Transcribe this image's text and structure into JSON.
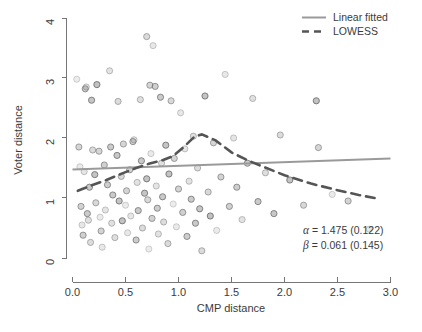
{
  "chart_data": {
    "type": "scatter",
    "title": "",
    "xlabel": "CMP distance",
    "ylabel": "Voter distance",
    "xlim": [
      0.0,
      3.0
    ],
    "ylim": [
      0.0,
      4.0
    ],
    "xticks": [
      0.0,
      0.5,
      1.0,
      1.5,
      2.0,
      2.5,
      3.0
    ],
    "xtick_labels": [
      "0.0",
      "0.5",
      "1.0",
      "1.5",
      "2.0",
      "2.5",
      "3.0"
    ],
    "yticks": [
      0,
      1,
      2,
      3,
      4
    ],
    "ytick_labels": [
      "0",
      "1",
      "2",
      "3",
      "4"
    ],
    "grid": false,
    "legend_position": "top-right",
    "point_color": "#8e8e8e",
    "point_edge_color": "#6d6d6d",
    "line_color_linear": "#9a9a9a",
    "line_color_lowess": "#555555",
    "legend": [
      {
        "label": "Linear fitted",
        "style": "solid",
        "color": "#9a9a9a"
      },
      {
        "label": "LOWESS",
        "style": "dashed",
        "color": "#555555"
      }
    ],
    "annotations": [
      {
        "symbol": "α",
        "text": " = 1.475 (0.122)"
      },
      {
        "symbol": "β",
        "text": " = 0.061 (0.145)"
      }
    ],
    "series": [
      {
        "name": "Linear fitted",
        "type": "line",
        "style": "solid",
        "x": [
          0.0,
          3.0
        ],
        "y": [
          1.475,
          1.658
        ]
      },
      {
        "name": "LOWESS",
        "type": "line",
        "style": "dashed",
        "x": [
          0.05,
          0.18,
          0.32,
          0.47,
          0.6,
          0.72,
          0.85,
          0.95,
          1.05,
          1.15,
          1.22,
          1.35,
          1.5,
          1.65,
          1.8,
          2.0,
          2.25,
          2.5,
          2.7,
          2.85
        ],
        "y": [
          1.12,
          1.21,
          1.3,
          1.41,
          1.5,
          1.57,
          1.63,
          1.7,
          1.85,
          2.02,
          2.06,
          1.96,
          1.76,
          1.63,
          1.52,
          1.38,
          1.24,
          1.13,
          1.05,
          1.0
        ]
      },
      {
        "name": "observations",
        "type": "scatter",
        "points": [
          [
            0.04,
            2.98
          ],
          [
            0.06,
            1.85
          ],
          [
            0.07,
            1.52
          ],
          [
            0.08,
            0.86
          ],
          [
            0.09,
            0.55
          ],
          [
            0.1,
            0.38
          ],
          [
            0.11,
            1.44
          ],
          [
            0.12,
            2.82
          ],
          [
            0.13,
            2.85
          ],
          [
            0.14,
            0.74
          ],
          [
            0.15,
            0.63
          ],
          [
            0.16,
            1.18
          ],
          [
            0.17,
            0.26
          ],
          [
            0.18,
            2.63
          ],
          [
            0.19,
            1.8
          ],
          [
            0.21,
            1.39
          ],
          [
            0.22,
            0.92
          ],
          [
            0.23,
            2.89
          ],
          [
            0.25,
            1.78
          ],
          [
            0.26,
            0.68
          ],
          [
            0.27,
            0.45
          ],
          [
            0.28,
            0.18
          ],
          [
            0.3,
            1.55
          ],
          [
            0.31,
            0.8
          ],
          [
            0.33,
            1.22
          ],
          [
            0.35,
            3.12
          ],
          [
            0.36,
            1.85
          ],
          [
            0.37,
            0.58
          ],
          [
            0.38,
            1.05
          ],
          [
            0.4,
            0.34
          ],
          [
            0.42,
            1.71
          ],
          [
            0.43,
            2.61
          ],
          [
            0.44,
            0.95
          ],
          [
            0.46,
            1.36
          ],
          [
            0.47,
            0.62
          ],
          [
            0.48,
            1.9
          ],
          [
            0.5,
            0.88
          ],
          [
            0.51,
            1.12
          ],
          [
            0.52,
            0.42
          ],
          [
            0.54,
            1.47
          ],
          [
            0.55,
            0.7
          ],
          [
            0.57,
            1.94
          ],
          [
            0.58,
            1.97
          ],
          [
            0.6,
            0.3
          ],
          [
            0.61,
            1.26
          ],
          [
            0.62,
            0.79
          ],
          [
            0.64,
            2.64
          ],
          [
            0.65,
            1.62
          ],
          [
            0.66,
            0.5
          ],
          [
            0.68,
            1.08
          ],
          [
            0.7,
            3.69
          ],
          [
            0.7,
            1.32
          ],
          [
            0.71,
            0.97
          ],
          [
            0.72,
            0.15
          ],
          [
            0.73,
            2.88
          ],
          [
            0.74,
            1.74
          ],
          [
            0.75,
            0.66
          ],
          [
            0.76,
            3.54
          ],
          [
            0.78,
            2.86
          ],
          [
            0.79,
            1.2
          ],
          [
            0.8,
            0.83
          ],
          [
            0.81,
            0.4
          ],
          [
            0.83,
            2.68
          ],
          [
            0.84,
            1.58
          ],
          [
            0.85,
            1.02
          ],
          [
            0.86,
            0.6
          ],
          [
            0.88,
            1.88
          ],
          [
            0.9,
            0.24
          ],
          [
            0.91,
            1.4
          ],
          [
            0.93,
            2.62
          ],
          [
            0.95,
            0.9
          ],
          [
            0.96,
            1.66
          ],
          [
            0.98,
            0.52
          ],
          [
            1.0,
            1.15
          ],
          [
            1.02,
            2.42
          ],
          [
            1.04,
            0.76
          ],
          [
            1.06,
            1.82
          ],
          [
            1.08,
            0.36
          ],
          [
            1.1,
            1.28
          ],
          [
            1.12,
            0.98
          ],
          [
            1.14,
            2.03
          ],
          [
            1.16,
            0.58
          ],
          [
            1.18,
            1.5
          ],
          [
            1.2,
            0.82
          ],
          [
            1.22,
            0.12
          ],
          [
            1.25,
            2.7
          ],
          [
            1.28,
            1.1
          ],
          [
            1.3,
            0.7
          ],
          [
            1.33,
            1.92
          ],
          [
            1.36,
            0.46
          ],
          [
            1.4,
            1.35
          ],
          [
            1.44,
            3.06
          ],
          [
            1.48,
            0.86
          ],
          [
            1.52,
            2.0
          ],
          [
            1.55,
            1.18
          ],
          [
            1.6,
            0.64
          ],
          [
            1.65,
            1.58
          ],
          [
            1.7,
            2.66
          ],
          [
            1.75,
            0.94
          ],
          [
            1.82,
            1.42
          ],
          [
            1.9,
            0.74
          ],
          [
            1.96,
            2.05
          ],
          [
            2.05,
            1.3
          ],
          [
            2.18,
            0.88
          ],
          [
            2.3,
            2.62
          ],
          [
            2.32,
            1.84
          ],
          [
            2.45,
            1.06
          ],
          [
            2.6,
            0.95
          ],
          [
            2.8,
            0.48
          ]
        ]
      }
    ]
  },
  "axes": {
    "x_title": "CMP distance",
    "y_title": "Voter distance"
  }
}
